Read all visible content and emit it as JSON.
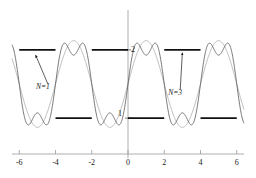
{
  "chart_data": {
    "type": "line",
    "title": "",
    "subtitle": "",
    "xlabel": "",
    "ylabel": "",
    "xlim": [
      -6.4,
      6.4
    ],
    "ylim": [
      -2.05,
      2.05
    ],
    "grid": false,
    "legend_position": "inline-annotations",
    "x_ticks": [
      -6,
      -4,
      -2,
      0,
      2,
      4,
      6
    ],
    "x_tick_labels": [
      "-6",
      "-4",
      "-2",
      "0",
      "2",
      "4",
      "6"
    ],
    "y_axis_marks": [
      {
        "value": 1,
        "label": "2"
      },
      {
        "value": -1,
        "label": "1"
      }
    ],
    "annotations": [
      {
        "text": "N=1",
        "x": -4.75,
        "y": -0.12,
        "points_to_x": -5.1,
        "points_to_y": 0.85
      },
      {
        "text": "N=3",
        "x": 2.55,
        "y": -0.28,
        "points_to_x": 3.0,
        "points_to_y": 0.92
      }
    ],
    "series": [
      {
        "name": "square-wave",
        "kind": "square",
        "color": "#111111",
        "width": 1.9,
        "period": 4,
        "amplitude": 1,
        "segments": [
          {
            "x0": -6,
            "x1": -6,
            "y": 1
          },
          {
            "x0": -6,
            "x1": -4,
            "y": 1
          },
          {
            "x0": -4,
            "x1": -2,
            "y": -1
          },
          {
            "x0": -2,
            "x1": 0,
            "y": 1
          },
          {
            "x0": 0,
            "x1": 2,
            "y": -1
          },
          {
            "x0": 2,
            "x1": 4,
            "y": 1
          },
          {
            "x0": 4,
            "x1": 6,
            "y": -1
          }
        ]
      },
      {
        "name": "fourier-N1",
        "kind": "fourier",
        "harmonics": 1,
        "color": "#aaaaaa",
        "width": 0.8,
        "amplitude": 1.27,
        "period": 4
      },
      {
        "name": "fourier-N3",
        "kind": "fourier",
        "harmonics": 3,
        "color": "#555555",
        "width": 0.8,
        "amplitude": 1.27,
        "period": 4
      }
    ],
    "axis_color": "#9a9a9a",
    "axis_tick_color": "#9a9a9a"
  },
  "figure": {
    "x_tick_labels": [
      "-6",
      "-4",
      "-2",
      "0",
      "2",
      "4",
      "6"
    ],
    "upper_level_label": "2",
    "lower_level_label": "1",
    "annotation_n1": "N=1",
    "annotation_n3": "N=3"
  }
}
